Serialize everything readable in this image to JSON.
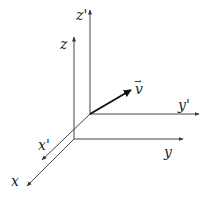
{
  "diagram": {
    "title": "",
    "labels": {
      "z_prime": "z'",
      "z": "z",
      "y_prime": "y'",
      "y": "y",
      "x_prime": "x'",
      "x": "x",
      "v": "v",
      "v_arrow": "→"
    },
    "colors": {
      "axis": "#444444",
      "vector": "#111111",
      "text": "#222222",
      "background": "#ffffff"
    }
  }
}
